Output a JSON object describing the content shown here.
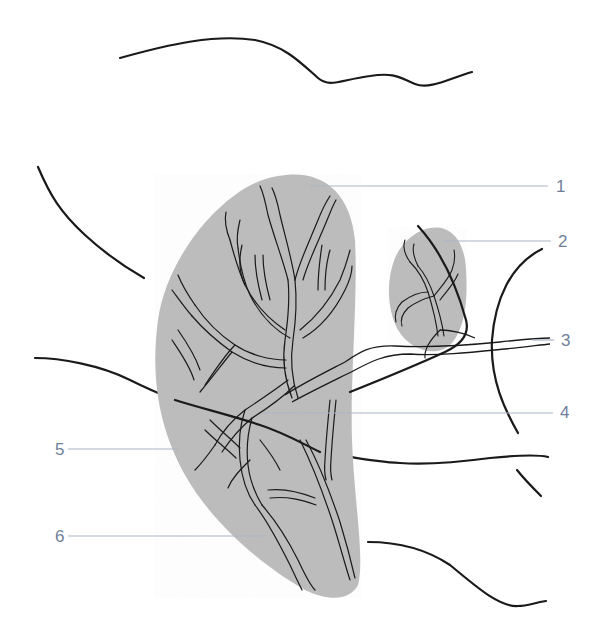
{
  "figure": {
    "type": "anatomical-line-diagram",
    "colors": {
      "outline": "#1a1a1a",
      "gland_fill": "#bdbdbd",
      "leader_line": "#a9b4c6",
      "label_text": "#6f7f9a",
      "background": "#ffffff"
    }
  },
  "labels": [
    {
      "id": "1",
      "text": "1",
      "x": 556,
      "y": 178,
      "line_from": [
        310,
        186
      ],
      "line_to": [
        548,
        186
      ]
    },
    {
      "id": "2",
      "text": "2",
      "x": 558,
      "y": 233,
      "line_from": [
        443,
        241
      ],
      "line_to": [
        551,
        241
      ]
    },
    {
      "id": "3",
      "text": "3",
      "x": 561,
      "y": 332,
      "line_from": [
        532,
        340
      ],
      "line_to": [
        554,
        340
      ]
    },
    {
      "id": "4",
      "text": "4",
      "x": 560,
      "y": 402,
      "line_from": [
        262,
        413
      ],
      "line_to": [
        553,
        413
      ]
    },
    {
      "id": "5",
      "text": "5",
      "x": 55,
      "y": 441,
      "line_from": [
        68,
        449
      ],
      "line_to": [
        178,
        449
      ]
    },
    {
      "id": "6",
      "text": "6",
      "x": 55,
      "y": 528,
      "line_from": [
        68,
        536
      ],
      "line_to": [
        266,
        536
      ]
    }
  ]
}
